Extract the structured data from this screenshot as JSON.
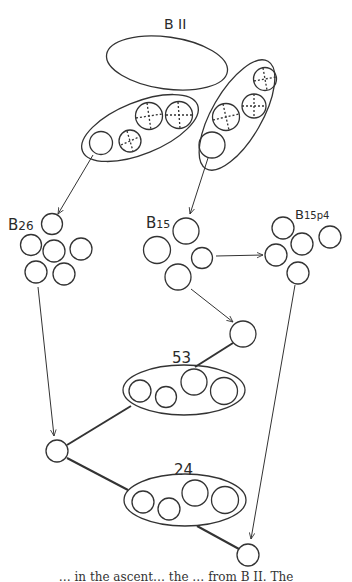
{
  "diagram": {
    "labels": {
      "origin": "B II",
      "b26": "B",
      "b26_sub": "26",
      "b15": "B",
      "b15_sub": "15",
      "b15p4": "B",
      "b15p4_sub": "15p4",
      "pop53": "53",
      "pop24": "24"
    },
    "nodes": [
      {
        "id": "BII",
        "label": "B II",
        "type": "parent-ellipse"
      },
      {
        "id": "B26",
        "label": "B26",
        "circles": 6
      },
      {
        "id": "B15",
        "label": "B15",
        "circles": 4
      },
      {
        "id": "B15p4",
        "label": "B15p4",
        "circles": 5
      },
      {
        "id": "53",
        "label": "53",
        "circles": 4,
        "type": "ellipse-group"
      },
      {
        "id": "24",
        "label": "24",
        "circles": 4,
        "type": "ellipse-group"
      }
    ],
    "edges": [
      {
        "from": "left-group",
        "to": "B26",
        "arrow": true
      },
      {
        "from": "right-group",
        "to": "B15",
        "arrow": true
      },
      {
        "from": "B15",
        "to": "B15p4",
        "arrow": true
      },
      {
        "from": "B15",
        "to": "node-right",
        "arrow": true
      },
      {
        "from": "node-right",
        "to": "53",
        "arrow": false
      },
      {
        "from": "B26",
        "to": "node-left",
        "arrow": true
      },
      {
        "from": "node-left",
        "to": "53",
        "arrow": false
      },
      {
        "from": "node-left",
        "to": "24",
        "arrow": false
      },
      {
        "from": "24",
        "to": "node-bottom",
        "arrow": false
      },
      {
        "from": "B15p4",
        "to": "node-bottom",
        "arrow": true
      }
    ]
  },
  "caption": {
    "text": "… in the ascent… the … from B II. The"
  }
}
